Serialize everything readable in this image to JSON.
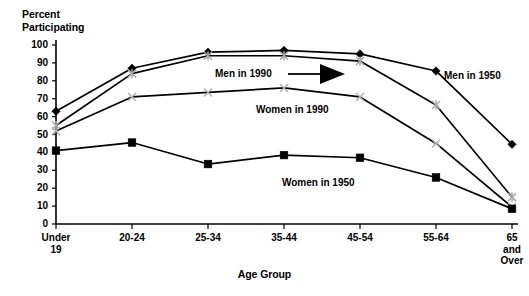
{
  "chart_data": {
    "type": "line",
    "title": "",
    "ylabel": "Percent\nParticipating",
    "xlabel": "Age Group",
    "ylim": [
      0,
      100
    ],
    "yticks": [
      0,
      10,
      20,
      30,
      40,
      50,
      60,
      70,
      80,
      90,
      100
    ],
    "grid": false,
    "legend_position": "inline-annotations",
    "categories": [
      "Under\n19",
      "20-24",
      "25-34",
      "35-44",
      "45-54",
      "55-64",
      "65\nand\nOver"
    ],
    "series": [
      {
        "name": "Men in 1990",
        "marker": "filled-diamond",
        "color": "#000000",
        "values": [
          63,
          87,
          96,
          97,
          95,
          85.5,
          44.5
        ]
      },
      {
        "name": "Men in 1950",
        "marker": "gray-star",
        "color": "#a8a8a8",
        "values": [
          55,
          84,
          94,
          94,
          91,
          66.5,
          15
        ]
      },
      {
        "name": "Women in 1990",
        "marker": "gray-x",
        "color": "#b0b0b0",
        "values": [
          52,
          71,
          73.5,
          76,
          71,
          45,
          9.5
        ]
      },
      {
        "name": "Women in 1950",
        "marker": "filled-square",
        "color": "#000000",
        "values": [
          41,
          45.5,
          33.5,
          38.5,
          37,
          26,
          8.5
        ]
      }
    ],
    "annotations": [
      {
        "text": "Men in 1990",
        "points_to": "men-1990-line",
        "arrow": "right"
      },
      {
        "text": "Men in 1950",
        "points_to": "men-1950-line",
        "arrow": "none"
      },
      {
        "text": "Women in 1990",
        "points_to": "women-1990-line",
        "arrow": "none"
      },
      {
        "text": "Women in 1950",
        "points_to": "women-1950-line",
        "arrow": "none"
      }
    ]
  },
  "axis": {
    "ytick_labels": [
      "100",
      "90",
      "80",
      "70",
      "60",
      "50",
      "40",
      "30",
      "20",
      "10",
      "0"
    ],
    "xtick_labels": [
      "Under\n19",
      "20-24",
      "25-34",
      "35-44",
      "45-54",
      "55-64",
      "65\nand\nOver"
    ]
  },
  "labels": {
    "y_axis_title": "Percent\nParticipating",
    "x_axis_title": "Age Group",
    "men_1990": "Men in 1990",
    "men_1950": "Men in 1950",
    "women_1990": "Women in 1990",
    "women_1950": "Women in 1950"
  }
}
